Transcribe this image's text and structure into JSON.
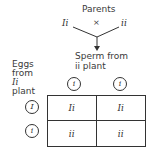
{
  "title": "Parents",
  "parents": {
    "left": "Ii",
    "cross": "×",
    "right": "ii"
  },
  "sperm_label": {
    "line1": "Sperm from",
    "line2": "ii plant"
  },
  "eggs_label": {
    "line1": "Eggs",
    "line2": "from",
    "line3": "Ii",
    "line4": "plant"
  },
  "sperm_alleles": [
    "i",
    "i"
  ],
  "egg_alleles": [
    "I",
    "i"
  ],
  "grid": [
    [
      "Ii",
      "Ii"
    ],
    [
      "ii",
      "ii"
    ]
  ]
}
